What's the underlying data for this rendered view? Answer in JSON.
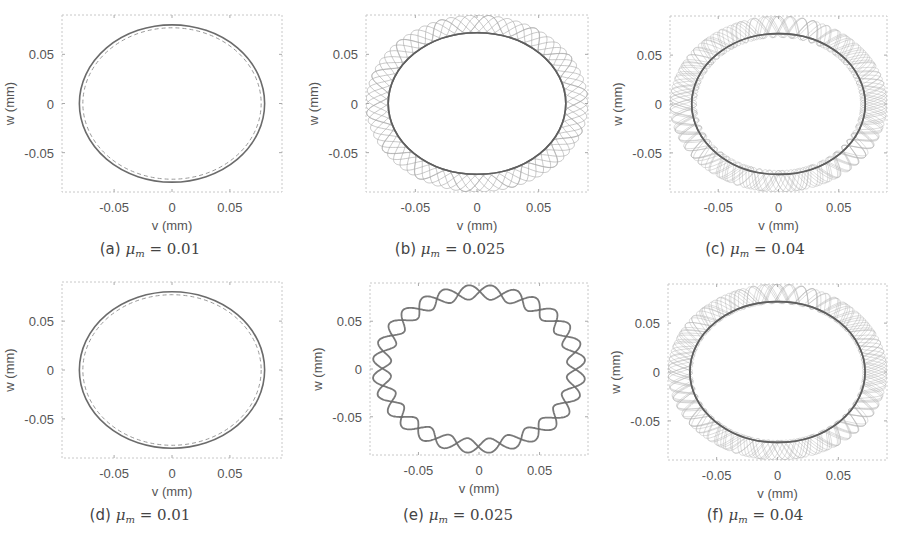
{
  "figure": {
    "panels": [
      {
        "id": "a",
        "caption_letter": "(a)",
        "mu_symbol": "μ",
        "mu_sub": "m",
        "mu_value": "= 0.01",
        "row": 0,
        "col": 0
      },
      {
        "id": "b",
        "caption_letter": "(b)",
        "mu_symbol": "μ",
        "mu_sub": "m",
        "mu_value": "= 0.025",
        "row": 0,
        "col": 1
      },
      {
        "id": "c",
        "caption_letter": "(c)",
        "mu_symbol": "μ",
        "mu_sub": "m",
        "mu_value": "= 0.04",
        "row": 0,
        "col": 2
      },
      {
        "id": "d",
        "caption_letter": "(d)",
        "mu_symbol": "μ",
        "mu_sub": "m",
        "mu_value": "= 0.01",
        "row": 1,
        "col": 0
      },
      {
        "id": "e",
        "caption_letter": "(e)",
        "mu_symbol": "μ",
        "mu_sub": "m",
        "mu_value": "= 0.025",
        "row": 1,
        "col": 1
      },
      {
        "id": "f",
        "caption_letter": "(f)",
        "mu_symbol": "μ",
        "mu_sub": "m",
        "mu_value": "= 0.04",
        "row": 1,
        "col": 2
      }
    ],
    "xlabel": "v (mm)",
    "ylabel": "w (mm)",
    "xticks": [
      "-0.05",
      "0",
      "0.05"
    ],
    "yticks": [
      "0.05",
      "0",
      "-0.05"
    ]
  },
  "chart_data": [
    {
      "type": "line",
      "title": "(a) μm = 0.01",
      "xlabel": "v (mm)",
      "ylabel": "w (mm)",
      "xlim": [
        -0.095,
        0.095
      ],
      "ylim": [
        -0.09,
        0.09
      ],
      "xticks": [
        -0.05,
        0,
        0.05
      ],
      "yticks": [
        -0.05,
        0,
        0.05
      ],
      "grid": false,
      "series": [
        {
          "name": "orbit (solid)",
          "shape": "ellipse",
          "semi_axis_v": 0.08,
          "semi_axis_w": 0.08
        },
        {
          "name": "reference (dashed)",
          "shape": "ellipse",
          "semi_axis_v": 0.077,
          "semi_axis_w": 0.077
        }
      ]
    },
    {
      "type": "line",
      "title": "(b) μm = 0.025",
      "xlabel": "v (mm)",
      "ylabel": "w (mm)",
      "xlim": [
        -0.09,
        0.09
      ],
      "ylim": [
        -0.09,
        0.09
      ],
      "xticks": [
        -0.05,
        0,
        0.05
      ],
      "yticks": [
        -0.05,
        0,
        0.05
      ],
      "grid": false,
      "series": [
        {
          "name": "inner orbit",
          "shape": "ellipse",
          "semi_axis_v": 0.072,
          "semi_axis_w": 0.072
        },
        {
          "name": "precessing band",
          "shape": "lobed band",
          "inner_radius": 0.072,
          "outer_radius": 0.09,
          "lobes": 14
        }
      ]
    },
    {
      "type": "line",
      "title": "(c) μm = 0.04",
      "xlabel": "v (mm)",
      "ylabel": "w (mm)",
      "xlim": [
        -0.09,
        0.09
      ],
      "ylim": [
        -0.09,
        0.09
      ],
      "xticks": [
        -0.05,
        0,
        0.05
      ],
      "yticks": [
        -0.05,
        0,
        0.05
      ],
      "grid": false,
      "series": [
        {
          "name": "inner orbit",
          "shape": "ellipse",
          "semi_axis_v": 0.072,
          "semi_axis_w": 0.072
        },
        {
          "name": "quasi-periodic band",
          "shape": "dense band",
          "inner_radius": 0.068,
          "outer_radius": 0.09
        }
      ]
    },
    {
      "type": "line",
      "title": "(d) μm = 0.01",
      "xlabel": "v (mm)",
      "ylabel": "w (mm)",
      "xlim": [
        -0.095,
        0.095
      ],
      "ylim": [
        -0.09,
        0.09
      ],
      "xticks": [
        -0.05,
        0,
        0.05
      ],
      "yticks": [
        -0.05,
        0,
        0.05
      ],
      "grid": false,
      "series": [
        {
          "name": "orbit (solid)",
          "shape": "ellipse",
          "semi_axis_v": 0.08,
          "semi_axis_w": 0.08
        },
        {
          "name": "reference (dashed)",
          "shape": "ellipse",
          "semi_axis_v": 0.077,
          "semi_axis_w": 0.077
        }
      ]
    },
    {
      "type": "line",
      "title": "(e) μm = 0.025",
      "xlabel": "v (mm)",
      "ylabel": "w (mm)",
      "xlim": [
        -0.09,
        0.09
      ],
      "ylim": [
        -0.09,
        0.09
      ],
      "xticks": [
        -0.05,
        0,
        0.05
      ],
      "yticks": [
        -0.05,
        0,
        0.05
      ],
      "grid": false,
      "series": [
        {
          "name": "braided orbit",
          "shape": "lobed band",
          "inner_radius": 0.073,
          "outer_radius": 0.088,
          "lobes": 14
        }
      ]
    },
    {
      "type": "line",
      "title": "(f) μm = 0.04",
      "xlabel": "v (mm)",
      "ylabel": "w (mm)",
      "xlim": [
        -0.09,
        0.09
      ],
      "ylim": [
        -0.09,
        0.09
      ],
      "xticks": [
        -0.05,
        0,
        0.05
      ],
      "yticks": [
        -0.05,
        0,
        0.05
      ],
      "grid": false,
      "series": [
        {
          "name": "inner orbit",
          "shape": "ellipse",
          "semi_axis_v": 0.072,
          "semi_axis_w": 0.072
        },
        {
          "name": "quasi-periodic band",
          "shape": "dense band",
          "inner_radius": 0.07,
          "outer_radius": 0.09
        }
      ]
    }
  ]
}
